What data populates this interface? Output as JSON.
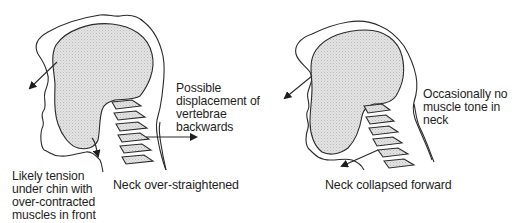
{
  "figure": {
    "left_panel": {
      "caption": "Neck over-straightened",
      "annotation_displacement": "Possible\ndisplacement of\nvertebrae\nbackwards",
      "annotation_tension": "Likely tension\nunder chin with\nover-contracted\nmuscles in front\nof neck"
    },
    "right_panel": {
      "caption": "Neck collapsed forward",
      "annotation_tone": "Occasionally no\nmuscle tone in\nneck"
    },
    "colors": {
      "line": "#2a2a2a",
      "skull_fill": "#d9d9d9",
      "background": "#ffffff"
    }
  }
}
